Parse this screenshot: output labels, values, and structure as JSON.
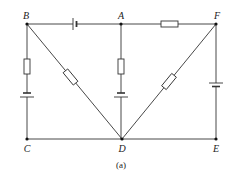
{
  "diagram": {
    "type": "circuit",
    "caption": "(a)",
    "nodes": {
      "B": {
        "label": "B"
      },
      "A": {
        "label": "A"
      },
      "F": {
        "label": "F"
      },
      "C": {
        "label": "C"
      },
      "D": {
        "label": "D"
      },
      "E": {
        "label": "E"
      }
    },
    "branches": [
      {
        "from": "B",
        "to": "A",
        "components": [
          "battery"
        ]
      },
      {
        "from": "A",
        "to": "F",
        "components": [
          "resistor"
        ]
      },
      {
        "from": "B",
        "to": "C",
        "components": [
          "resistor",
          "battery"
        ]
      },
      {
        "from": "A",
        "to": "D",
        "components": [
          "resistor",
          "battery"
        ]
      },
      {
        "from": "F",
        "to": "E",
        "components": [
          "battery"
        ]
      },
      {
        "from": "B",
        "to": "D",
        "components": [
          "resistor"
        ]
      },
      {
        "from": "F",
        "to": "D",
        "components": [
          "resistor"
        ]
      },
      {
        "from": "C",
        "to": "D",
        "components": []
      },
      {
        "from": "D",
        "to": "E",
        "components": []
      }
    ],
    "colors": {
      "line": "#333333",
      "background": "#ffffff"
    }
  }
}
